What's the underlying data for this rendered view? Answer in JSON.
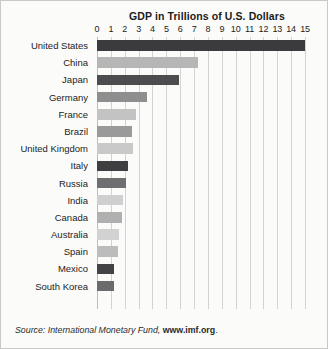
{
  "chart_data": {
    "type": "bar",
    "orientation": "horizontal",
    "title": "GDP in Trillions of U.S. Dollars",
    "xlabel": "",
    "ylabel": "",
    "xlim": [
      0,
      15
    ],
    "ylim": null,
    "grid": true,
    "legend": null,
    "xticks": [
      "0",
      "1",
      "2",
      "3",
      "4",
      "5",
      "6",
      "7",
      "8",
      "9",
      "10",
      "11",
      "12",
      "13",
      "14",
      "15"
    ],
    "xtick_values": [
      0,
      1,
      2,
      3,
      4,
      5,
      6,
      7,
      8,
      9,
      10,
      11,
      12,
      13,
      14,
      15
    ],
    "categories": [
      "United States",
      "China",
      "Japan",
      "Germany",
      "France",
      "Brazil",
      "United Kingdom",
      "Italy",
      "Russia",
      "India",
      "Canada",
      "Australia",
      "Spain",
      "Mexico",
      "South Korea"
    ],
    "values": [
      15.0,
      7.3,
      5.9,
      3.6,
      2.8,
      2.5,
      2.6,
      2.2,
      2.1,
      1.9,
      1.8,
      1.6,
      1.5,
      1.2,
      1.2
    ],
    "bar_colors": [
      "#3b3b3d",
      "#b6b6b6",
      "#4d4d4f",
      "#8e8e8e",
      "#c3c3c3",
      "#9a9a9a",
      "#c9c9c9",
      "#3f3f41",
      "#6f6f71",
      "#cfcfcf",
      "#b0b0b0",
      "#d2d2d2",
      "#bcbcbc",
      "#434345",
      "#6b6b6d"
    ],
    "annotations": []
  },
  "source": {
    "prefix": "Source: International Monetary Fund,",
    "url": "www.imf.org",
    "suffix": "."
  },
  "colors": {
    "background": "#fbfbfa",
    "border": "#c9c9c7",
    "gridline": "#d2d2d0",
    "text": "#1b1b1b"
  }
}
